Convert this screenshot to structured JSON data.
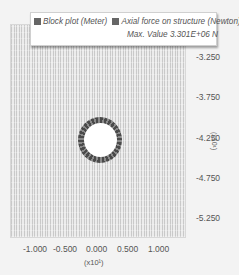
{
  "legend": {
    "item1_label": "Block plot (Meter)",
    "item2_label": "Axial force on structure (Newton)",
    "max_value": "Max. Value 3.301E+06 N",
    "swatch_color": "#666666"
  },
  "y_axis": {
    "ticks": [
      "-3.250",
      "-3.750",
      "-4.250",
      "-4.750",
      "-5.250",
      "-5.750"
    ],
    "exponent": "(x10¹)"
  },
  "x_axis": {
    "ticks": [
      "-1.000",
      "-0.500",
      "0.000",
      "0.500",
      "1.000"
    ],
    "exponent": "(x10¹)"
  },
  "colors": {
    "mesh_dark": "#c9c9c9",
    "mesh_light": "#ececec",
    "ring_dark": "#4a4a4a",
    "ring_light": "#8a8a8a"
  }
}
